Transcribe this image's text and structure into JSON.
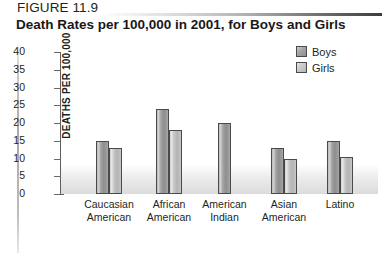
{
  "figure": {
    "number_label": "FIGURE 11.9",
    "title": "Death Rates per 100,000 in 2001, for Boys and Girls"
  },
  "chart_data": {
    "type": "bar",
    "title": "Death Rates per 100,000 in 2001, for Boys and Girls",
    "xlabel": "",
    "ylabel": "DEATHS PER 100,000",
    "ylim": [
      0,
      40
    ],
    "ytick_step": 5,
    "yticks": [
      40,
      35,
      30,
      25,
      20,
      15,
      10,
      5,
      0
    ],
    "grid": false,
    "legend_position": "top-right",
    "categories": [
      "Caucasian American",
      "African American",
      "American Indian",
      "Asian American",
      "Latino"
    ],
    "category_lines": [
      [
        "Caucasian",
        "American"
      ],
      [
        "African",
        "American"
      ],
      [
        "American",
        "Indian"
      ],
      [
        "Asian",
        "American"
      ],
      [
        "Latino"
      ]
    ],
    "series": [
      {
        "name": "Boys",
        "color": "#9a9a9a",
        "values": [
          15,
          24,
          20,
          13,
          15
        ]
      },
      {
        "name": "Girls",
        "color": "#c6c6c6",
        "values": [
          13,
          18,
          null,
          10,
          10.5
        ]
      }
    ]
  },
  "legend": {
    "items": [
      {
        "label": "Boys"
      },
      {
        "label": "Girls"
      }
    ]
  }
}
